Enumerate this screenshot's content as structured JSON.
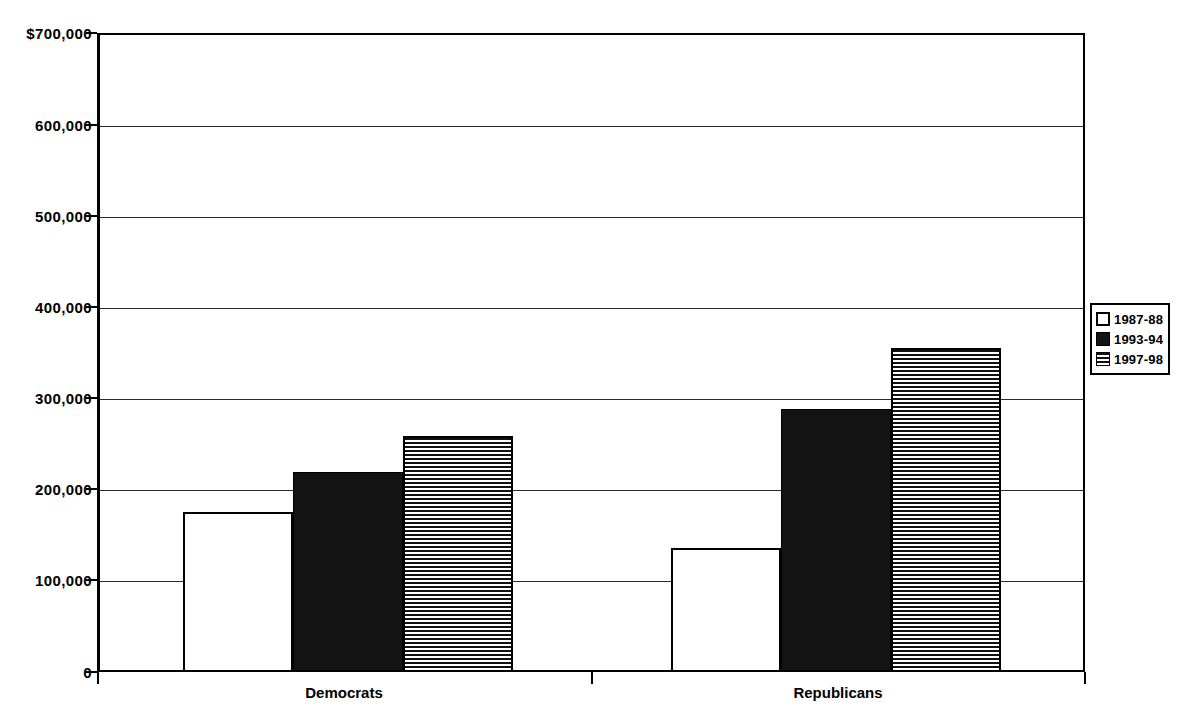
{
  "chart_data": {
    "type": "bar",
    "title": "",
    "xlabel": "",
    "ylabel": "",
    "categories": [
      "Democrats",
      "Republicans"
    ],
    "series": [
      {
        "name": "1987-88",
        "pattern": "white",
        "values": [
          173000,
          134000
        ]
      },
      {
        "name": "1993-94",
        "pattern": "black",
        "values": [
          217000,
          286000
        ]
      },
      {
        "name": "1997-98",
        "pattern": "hstripe",
        "values": [
          256000,
          353000
        ]
      }
    ],
    "ylim": [
      0,
      700000
    ],
    "ytick_values": [
      0,
      100000,
      200000,
      300000,
      400000,
      500000,
      600000,
      700000
    ],
    "ytick_labels": [
      "0",
      "100,000",
      "200,000",
      "300,000",
      "400,000",
      "500,000",
      "600,000",
      "$700,000"
    ],
    "grid": true,
    "legend_position": "right"
  },
  "legend": {
    "items": [
      {
        "label": "1987-88",
        "swatch": "white-square-icon"
      },
      {
        "label": "1993-94",
        "swatch": "black-square-icon"
      },
      {
        "label": "1997-98",
        "swatch": "striped-square-icon"
      }
    ]
  },
  "colors": {
    "axis": "#000000",
    "grid": "#2a2a2a",
    "bar_black": "#131313",
    "bar_white": "#ffffff",
    "background": "#ffffff"
  }
}
